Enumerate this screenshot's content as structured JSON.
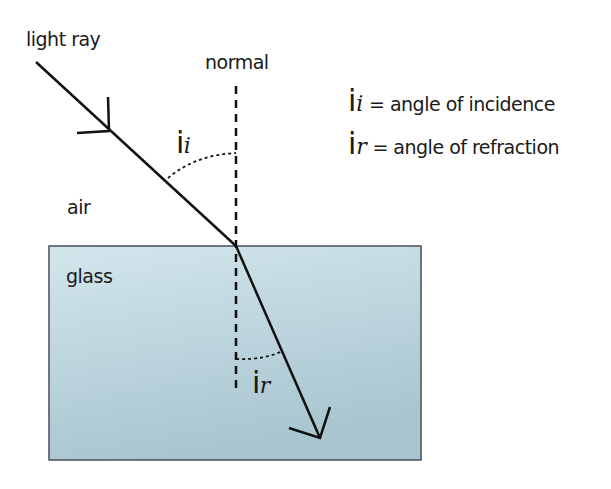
{
  "diagram": {
    "type": "refraction",
    "labels": {
      "light_ray": "light ray",
      "normal": "normal",
      "air": "air",
      "glass": "glass"
    },
    "angle_labels": {
      "incidence": {
        "symbol": "i",
        "subscript": "i"
      },
      "refraction": {
        "symbol": "i",
        "subscript": "r"
      }
    },
    "legend": [
      {
        "symbol": "i",
        "subscript": "i",
        "text": " = angle of incidence"
      },
      {
        "symbol": "i",
        "subscript": "r",
        "text": " = angle of refraction"
      }
    ],
    "colors": {
      "line": "#111111",
      "glass_top": "#cfe3ea",
      "glass_bottom": "#a9c6d1",
      "glass_border": "#4a4f55"
    }
  }
}
